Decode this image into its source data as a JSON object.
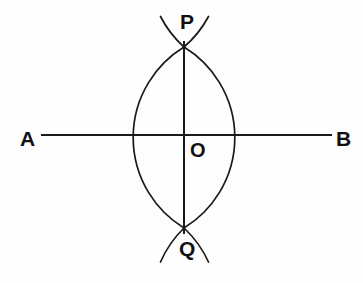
{
  "figure": {
    "background_color": "#fefefe",
    "stroke_color": "#1a1a1a",
    "label_color": "#111111",
    "width": 363,
    "height": 283
  },
  "labels": {
    "a": "A",
    "b": "B",
    "p": "P",
    "q": "Q",
    "o": "O"
  },
  "chart_data": {
    "type": "diagram",
    "subtype": "geometric-construction",
    "points": [
      {
        "name": "A",
        "x": 41,
        "y": 135,
        "label": "A"
      },
      {
        "name": "B",
        "x": 332,
        "y": 135,
        "label": "B"
      },
      {
        "name": "P",
        "x": 184,
        "y": 47,
        "label": "P"
      },
      {
        "name": "Q",
        "x": 184,
        "y": 228,
        "label": "Q"
      },
      {
        "name": "O",
        "x": 184,
        "y": 135,
        "label": "O"
      }
    ],
    "lines": [
      {
        "name": "AB",
        "from": "A",
        "to": "B",
        "x1": 41,
        "y1": 135,
        "x2": 332,
        "y2": 135
      },
      {
        "name": "PQ",
        "from": "P",
        "to": "Q",
        "x1": 184,
        "y1": 41,
        "x2": 184,
        "y2": 234
      }
    ],
    "arcs": [
      {
        "name": "left-arc",
        "start_x": 184,
        "start_y": 47,
        "end_x": 184,
        "end_y": 228,
        "bulge_x": 155,
        "radius": 106,
        "sweep": 0
      },
      {
        "name": "right-arc",
        "start_x": 184,
        "start_y": 47,
        "end_x": 184,
        "end_y": 228,
        "bulge_x": 213,
        "radius": 106,
        "sweep": 1
      }
    ],
    "arc_tails": [
      {
        "name": "upper-left-tail",
        "x1": 160,
        "y1": 17,
        "x2": 184,
        "y2": 47
      },
      {
        "name": "upper-right-tail",
        "x1": 209,
        "y1": 17,
        "x2": 184,
        "y2": 47
      },
      {
        "name": "lower-left-tail",
        "x1": 160,
        "y1": 264,
        "x2": 184,
        "y2": 228
      },
      {
        "name": "lower-right-tail",
        "x1": 209,
        "y1": 264,
        "x2": 184,
        "y2": 228
      }
    ],
    "annotations": [
      "A and B are the endpoints of the base line",
      "P is the upper arc intersection",
      "Q is the lower arc intersection",
      "O is the midpoint where PQ meets AB"
    ],
    "title": "",
    "xlabel": "",
    "ylabel": "",
    "grid": false,
    "legend": false
  }
}
